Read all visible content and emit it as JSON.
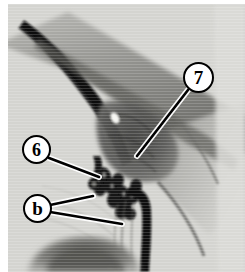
{
  "figure": {
    "type": "grayscale-micrograph",
    "width": 245,
    "height": 272,
    "background_color": "#ffffff",
    "plate_color": "#d9d9d6",
    "border": {
      "left": 8,
      "top": 4,
      "right": 0,
      "bottom": 0
    }
  },
  "annotations": {
    "line_color": "#000000",
    "line_halo_color": "#ffffff",
    "marker_fill": "#ffffff",
    "marker_stroke": "#000000",
    "items": [
      {
        "id": "marker-7",
        "label": "7",
        "shape": "circle",
        "center": {
          "x": 198,
          "y": 78
        },
        "radius": 15,
        "leader": {
          "from": {
            "x": 188,
            "y": 90
          },
          "to": {
            "x": 137,
            "y": 156
          }
        }
      },
      {
        "id": "marker-6",
        "label": "6",
        "shape": "circle",
        "center": {
          "x": 37,
          "y": 150
        },
        "radius": 14,
        "leader": {
          "from": {
            "x": 49,
            "y": 158
          },
          "to": {
            "x": 99,
            "y": 177
          }
        }
      },
      {
        "id": "marker-b",
        "label": "b",
        "shape": "circle",
        "center": {
          "x": 37,
          "y": 208
        },
        "radius": 14,
        "leaders": [
          {
            "from": {
              "x": 50,
              "y": 205
            },
            "to": {
              "x": 93,
              "y": 196
            }
          },
          {
            "from": {
              "x": 50,
              "y": 212
            },
            "to": {
              "x": 122,
              "y": 224
            }
          }
        ]
      }
    ]
  },
  "specimen": {
    "description": "Histological section showing a dark elongated diagonal band from upper-left, a broad tissue band running to lower-right, a cluster of dark rounded nodules at center, a thick dark vertical strand descending at center-right, and a dark dome-shaped body at lower-left.",
    "features": [
      {
        "name": "upper-left-dark-band",
        "tone": "#2a2a2a"
      },
      {
        "name": "upper-tissue-band",
        "tone": "#9a9a96"
      },
      {
        "name": "central-dark-mass",
        "tone": "#4a4a48"
      },
      {
        "name": "nodule-cluster",
        "tone": "#151515"
      },
      {
        "name": "descending-dark-strand",
        "tone": "#111111"
      },
      {
        "name": "lower-dome-body",
        "tone": "#6d6d6a"
      },
      {
        "name": "white-highlight-spot",
        "tone": "#f4f4f0"
      },
      {
        "name": "background-matrix",
        "tone": "#d6d6d2"
      }
    ]
  }
}
